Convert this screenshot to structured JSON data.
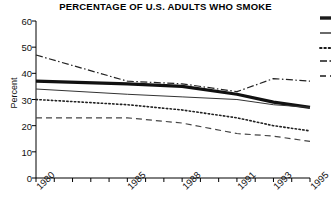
{
  "chart": {
    "title": "PERCENTAGE OF U.S. ADULTS WHO SMOKE",
    "ylabel": "Percent"
  },
  "chart_data": {
    "type": "line",
    "title": "PERCENTAGE OF U.S. ADULTS WHO SMOKE",
    "xlabel": "",
    "ylabel": "Percent",
    "ylim": [
      0,
      60
    ],
    "yticks": [
      0,
      10,
      20,
      30,
      40,
      50,
      60
    ],
    "xlim": [
      1980,
      1995
    ],
    "xticks": [
      1980,
      1981,
      1982,
      1983,
      1984,
      1985,
      1986,
      1987,
      1988,
      1989,
      1990,
      1991,
      1992,
      1993,
      1994,
      1995
    ],
    "xticklabels": [
      "1980",
      "",
      "",
      "",
      "",
      "1985",
      "",
      "",
      "1988",
      "",
      "",
      "1991",
      "",
      "1993",
      "",
      "1995"
    ],
    "grid": false,
    "legend_position": "right",
    "x": [
      1980,
      1985,
      1988,
      1991,
      1993,
      1995
    ],
    "series": [
      {
        "name": "series-1",
        "style": "dash-dot",
        "linewidth": 1.2,
        "color": "#222222",
        "values": [
          47,
          37,
          36,
          33,
          38,
          37
        ]
      },
      {
        "name": "series-2",
        "style": "solid-thick",
        "linewidth": 3.2,
        "color": "#111111",
        "values": [
          37,
          36,
          35,
          32,
          29,
          27
        ]
      },
      {
        "name": "series-3",
        "style": "solid-thin",
        "linewidth": 1.0,
        "color": "#333333",
        "values": [
          34,
          32,
          31,
          30,
          28,
          27
        ]
      },
      {
        "name": "series-4",
        "style": "dotted",
        "linewidth": 1.6,
        "color": "#222222",
        "values": [
          30,
          28,
          26,
          23,
          20,
          18
        ]
      },
      {
        "name": "series-5",
        "style": "dashed",
        "linewidth": 1.2,
        "color": "#444444",
        "values": [
          23,
          23,
          21,
          17,
          16,
          14
        ]
      }
    ]
  },
  "legend": {
    "cropped": true,
    "swatches": [
      {
        "name": "legend-swatch-1",
        "style": "solid-thick"
      },
      {
        "name": "legend-swatch-2",
        "style": "solid-thin"
      },
      {
        "name": "legend-swatch-3",
        "style": "dotted"
      },
      {
        "name": "legend-swatch-4",
        "style": "dash-dot"
      },
      {
        "name": "legend-swatch-5",
        "style": "dashed"
      }
    ]
  }
}
